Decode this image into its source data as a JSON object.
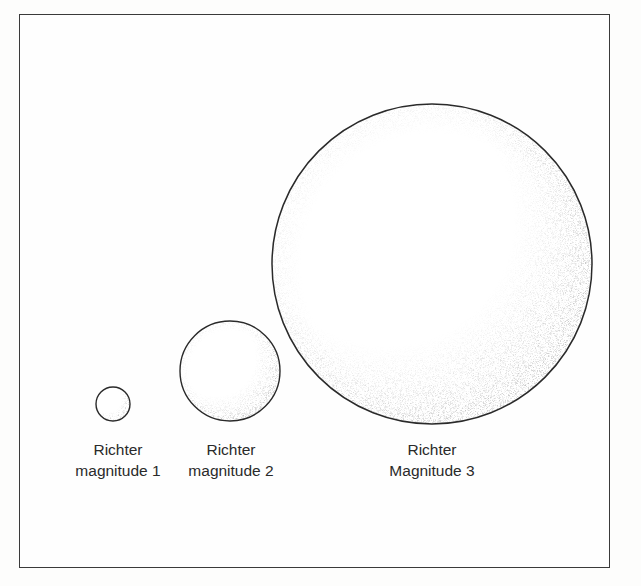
{
  "figure": {
    "circles": [
      {
        "id": "magnitude-1",
        "cx": 113,
        "cy": 404,
        "r": 17,
        "label_line1": "Richter",
        "label_line2": "magnitude 1",
        "label_x": 118,
        "label_y": 439
      },
      {
        "id": "magnitude-2",
        "cx": 230,
        "cy": 371,
        "r": 50,
        "label_line1": "Richter",
        "label_line2": "magnitude 2",
        "label_x": 231,
        "label_y": 439
      },
      {
        "id": "magnitude-3",
        "cx": 432,
        "cy": 264,
        "r": 160,
        "label_line1": "Richter",
        "label_line2": "Magnitude 3",
        "label_x": 432,
        "label_y": 439
      }
    ],
    "colors": {
      "outline": "#2a2a2a",
      "stipple": "#8a8a8a",
      "text": "#2a2a2a",
      "frame": "#3a3a3a"
    }
  }
}
